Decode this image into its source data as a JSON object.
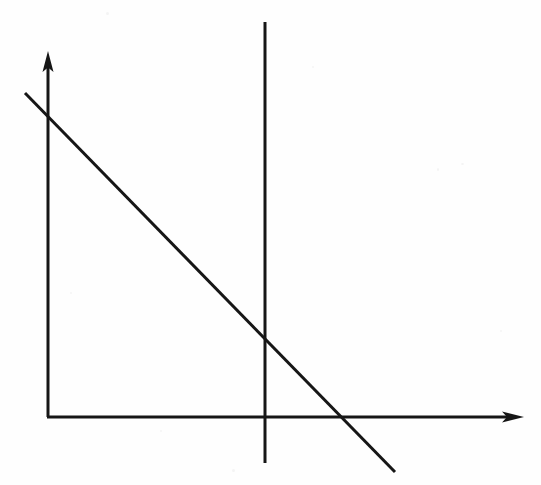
{
  "figure": {
    "title": "",
    "background_color": "#fefefe",
    "ink_color": "#161616",
    "width": 541,
    "height": 485,
    "has_labels": false,
    "has_tick_marks": false,
    "has_gridlines": false
  },
  "chart_data": {
    "type": "line",
    "title": "",
    "subtitle": "",
    "xlabel": "",
    "ylabel": "",
    "grid": false,
    "legend": false,
    "legend_position": "none",
    "axes": {
      "origin_px": [
        48,
        417
      ],
      "x_axis": {
        "name": "horizontal-axis",
        "from_px": [
          48,
          417
        ],
        "to_px": [
          522,
          417
        ],
        "arrow": "right",
        "tick_labels": [],
        "range_shown": "positive direction only"
      },
      "y_axis": {
        "name": "vertical-axis",
        "from_px": [
          48,
          417
        ],
        "to_px": [
          48,
          52
        ],
        "arrow": "up",
        "tick_labels": [],
        "range_shown": "positive direction only"
      }
    },
    "series": [
      {
        "name": "downward-sloping-line",
        "style": "solid",
        "color": "#161616",
        "stroke_width_px": 3,
        "points_px": [
          [
            25,
            93
          ],
          [
            395,
            472
          ]
        ],
        "slope_px": -1.02,
        "y_axis_intercept_px": [
          48,
          116
        ],
        "x_axis_intercept_px": [
          336,
          417
        ],
        "crosses_reference_line_at_px": [
          265,
          340
        ]
      },
      {
        "name": "vertical-reference-line",
        "style": "solid",
        "color": "#161616",
        "stroke_width_px": 3,
        "points_px": [
          [
            265,
            22
          ],
          [
            265,
            463
          ]
        ],
        "orientation": "vertical",
        "x_position_px": 265
      }
    ],
    "annotations": [],
    "xlim": [
      0,
      541
    ],
    "ylim": [
      485,
      0
    ]
  },
  "arrows": {
    "y_arrow": {
      "name": "y-axis-arrowhead",
      "tip_px": [
        48,
        51
      ],
      "base_px": [
        48,
        70
      ],
      "half_width_px": 6
    },
    "x_arrow": {
      "name": "x-axis-arrowhead",
      "tip_px": [
        523,
        417
      ],
      "base_px": [
        504,
        417
      ],
      "half_width_px": 6
    }
  }
}
